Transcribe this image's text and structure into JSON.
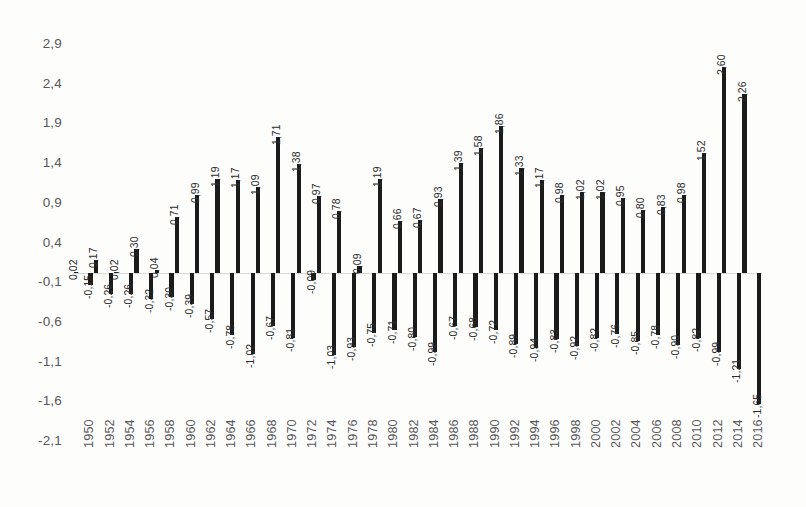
{
  "chart_data": {
    "type": "bar",
    "title": "",
    "subtitle": "",
    "xlabel": "",
    "ylabel": "",
    "ylim": [
      -2.1,
      2.9
    ],
    "grid": false,
    "legend": null,
    "decimal_separator": ",",
    "y_ticks": [
      "2,9",
      "2,4",
      "1,9",
      "1,4",
      "0,9",
      "0,4",
      "-0,1",
      "-0,6",
      "-1,1",
      "-1,6",
      "-2,1"
    ],
    "y_tick_values": [
      2.9,
      2.4,
      1.9,
      1.4,
      0.9,
      0.4,
      -0.1,
      -0.6,
      -1.1,
      -1.6,
      -2.1
    ],
    "x_tick_labels": [
      "1950",
      "1952",
      "1954",
      "1956",
      "1958",
      "1960",
      "1962",
      "1964",
      "1966",
      "1968",
      "1970",
      "1972",
      "1974",
      "1976",
      "1978",
      "1980",
      "1982",
      "1984",
      "1986",
      "1988",
      "1990",
      "1992",
      "1994",
      "1996",
      "1998",
      "2000",
      "2002",
      "2004",
      "2006",
      "2008",
      "2010",
      "2012",
      "2014",
      "2016"
    ],
    "x_tick_step_years": 2,
    "year_start": 1950,
    "year_end": 2017,
    "categories": [
      1950,
      1951,
      1952,
      1953,
      1954,
      1955,
      1956,
      1957,
      1958,
      1959,
      1960,
      1961,
      1962,
      1963,
      1964,
      1965,
      1966,
      1967,
      1968,
      1969,
      1970,
      1971,
      1972,
      1973,
      1974,
      1975,
      1976,
      1977,
      1978,
      1979,
      1980,
      1981,
      1982,
      1983,
      1984,
      1985,
      1986,
      1987,
      1988,
      1989,
      1990,
      1991,
      1992,
      1993,
      1994,
      1995,
      1996,
      1997,
      1998,
      1999,
      2000,
      2001,
      2002,
      2003,
      2004,
      2005,
      2006,
      2007,
      2008,
      2009,
      2010,
      2011,
      2012,
      2013,
      2014,
      2015,
      2016,
      2017
    ],
    "series": [
      {
        "name": "positive",
        "values": [
          0.02,
          null,
          0.17,
          null,
          0.02,
          null,
          0.3,
          null,
          0.04,
          null,
          0.71,
          null,
          0.99,
          null,
          1.19,
          null,
          1.17,
          null,
          1.09,
          null,
          1.71,
          null,
          1.38,
          null,
          0.97,
          null,
          0.78,
          null,
          0.09,
          null,
          1.19,
          null,
          0.66,
          null,
          0.67,
          null,
          0.93,
          null,
          1.39,
          null,
          1.58,
          null,
          1.86,
          null,
          1.33,
          null,
          1.17,
          null,
          0.98,
          null,
          1.02,
          null,
          1.02,
          null,
          0.95,
          null,
          0.8,
          null,
          0.83,
          null,
          0.98,
          null,
          1.52,
          null,
          2.6,
          null,
          2.26,
          null
        ],
        "labels": [
          "0,02",
          "",
          "0,17",
          "",
          "0,02",
          "",
          "0,30",
          "",
          "0,04",
          "",
          "0,71",
          "",
          "0,99",
          "",
          "1,19",
          "",
          "1,17",
          "",
          "1,09",
          "",
          "1,71",
          "",
          "1,38",
          "",
          "0,97",
          "",
          "0,78",
          "",
          "0,09",
          "",
          "1,19",
          "",
          "0,66",
          "",
          "0,67",
          "",
          "0,93",
          "",
          "1,39",
          "",
          "1,58",
          "",
          "1,86",
          "",
          "1,33",
          "",
          "1,17",
          "",
          "0,98",
          "",
          "1,02",
          "",
          "1,02",
          "",
          "0,95",
          "",
          "0,80",
          "",
          "0,83",
          "",
          "0,98",
          "",
          "1,52",
          "",
          "2,60",
          "",
          "2,26",
          ""
        ]
      },
      {
        "name": "negative",
        "values": [
          null,
          -0.15,
          null,
          -0.26,
          null,
          -0.26,
          null,
          -0.32,
          null,
          -0.3,
          null,
          -0.39,
          null,
          -0.57,
          null,
          -0.78,
          null,
          -1.02,
          null,
          -0.67,
          null,
          -0.81,
          null,
          -0.09,
          null,
          -1.03,
          null,
          -0.93,
          null,
          -0.75,
          null,
          -0.71,
          null,
          -0.8,
          null,
          -0.99,
          null,
          -0.67,
          null,
          -0.68,
          null,
          -0.72,
          null,
          -0.89,
          null,
          -0.94,
          null,
          -0.83,
          null,
          -0.92,
          null,
          -0.82,
          null,
          -0.76,
          null,
          -0.85,
          null,
          -0.78,
          null,
          -0.9,
          null,
          -0.82,
          null,
          -0.99,
          null,
          -1.21,
          null,
          -1.65
        ],
        "labels": [
          "",
          "-0,15",
          "",
          "-0,26",
          "",
          "-0,26",
          "",
          "-0,32",
          "",
          "-0,30",
          "",
          "-0,39",
          "",
          "-0,57",
          "",
          "-0,78",
          "",
          "-1,02",
          "",
          "-0,67",
          "",
          "-0,81",
          "",
          "-0,09",
          "",
          "-1,03",
          "",
          "-0,93",
          "",
          "-0,75",
          "",
          "-0,71",
          "",
          "-0,80",
          "",
          "-0,99",
          "",
          "-0,67",
          "",
          "-0,68",
          "",
          "-0,72",
          "",
          "-0,89",
          "",
          "-0,94",
          "",
          "-0,83",
          "",
          "-0,92",
          "",
          "-0,82",
          "",
          "-0,76",
          "",
          "-0,85",
          "",
          "-0,78",
          "",
          "-0,90",
          "",
          "-0,82",
          "",
          "-0,99",
          "",
          "-1,21",
          "",
          "-1,65"
        ]
      }
    ],
    "bar_color": "#1b1b1b",
    "axis_label_color": "#58585a",
    "data_label_color": "#2b2b2b"
  }
}
